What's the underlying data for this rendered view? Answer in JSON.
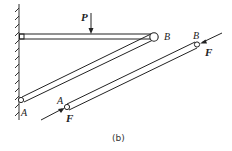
{
  "diagram": {
    "caption": "(b)",
    "labels": {
      "load": "P",
      "pin_b_structure": "B",
      "pin_a_structure": "A",
      "member_end_a": "A",
      "member_end_b": "B",
      "force_at_a": "F",
      "force_at_b": "F"
    },
    "elements": [
      "fixed wall (hatched) on left",
      "horizontal beam from wall to pin B with load P",
      "inclined strut from pin A on wall to pin B",
      "free-body diagram of two-force member AB with forces F at both ends"
    ],
    "colors": {
      "line": "#222222",
      "background": "#ffffff"
    }
  }
}
